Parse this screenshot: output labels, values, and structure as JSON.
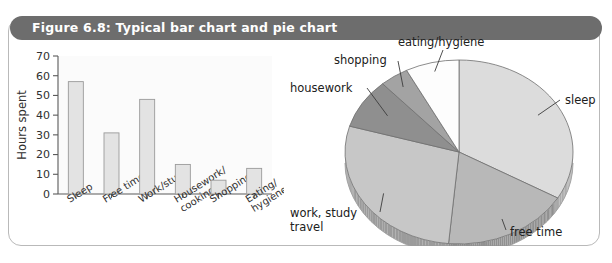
{
  "figure": {
    "caption": "Figure 6.8: Typical bar chart and pie chart",
    "caption_bar_color": "#6d6d6d",
    "frame_border_color": "#b9b9b9"
  },
  "chart_data": [
    {
      "type": "bar",
      "title": "",
      "xlabel": "",
      "ylabel": "Hours spent",
      "categories": [
        "Sleep",
        "Free time",
        "Work/study",
        "Housework/ cooking",
        "Shopping",
        "Eating/ hygiene"
      ],
      "category_lines": [
        [
          "Sleep"
        ],
        [
          "Free time"
        ],
        [
          "Work/study"
        ],
        [
          "Housework/",
          "cooking"
        ],
        [
          "Shopping"
        ],
        [
          "Eating/",
          "hygiene"
        ]
      ],
      "values": [
        57,
        31,
        48,
        15,
        7,
        13
      ],
      "ylim": [
        0,
        70
      ],
      "yticks": [
        0,
        10,
        20,
        30,
        40,
        50,
        60,
        70
      ],
      "ytick_labels": [
        "0",
        "10",
        "20",
        "30",
        "40",
        "50",
        "60",
        "70"
      ],
      "grid": false,
      "legend": "none",
      "bar_fill": "#e3e3e3",
      "bar_stroke": "#9a9a9a"
    },
    {
      "type": "pie",
      "title": "",
      "legend": "callout-labels",
      "labels": [
        "sleep",
        "free time",
        "work, study travel",
        "housework",
        "shopping",
        "eating/hygiene"
      ],
      "label_lines": [
        [
          "sleep"
        ],
        [
          "free time"
        ],
        [
          "work, study",
          "travel"
        ],
        [
          "housework"
        ],
        [
          "shopping"
        ],
        [
          "eating/hygiene"
        ]
      ],
      "values": [
        57,
        31,
        48,
        15,
        7,
        13
      ],
      "percentages": [
        33.5,
        18.2,
        28.2,
        8.8,
        4.1,
        7.2
      ],
      "slice_colors": [
        "#dcdcdc",
        "#b8b8b8",
        "#c7c7c7",
        "#8f8f8f",
        "#a3a3a3",
        "#fdfdfd"
      ],
      "start_angle_deg": -90,
      "rim_color": "#a0a0a0"
    }
  ]
}
